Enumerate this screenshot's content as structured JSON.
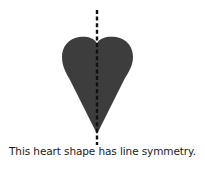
{
  "figure": {
    "shape": "heart",
    "fill_color": "#3d3d3d",
    "axis_line_color": "#111111",
    "axis_orientation": "vertical",
    "axis_style": "dashed"
  },
  "caption": "This heart shape has line symmetry."
}
